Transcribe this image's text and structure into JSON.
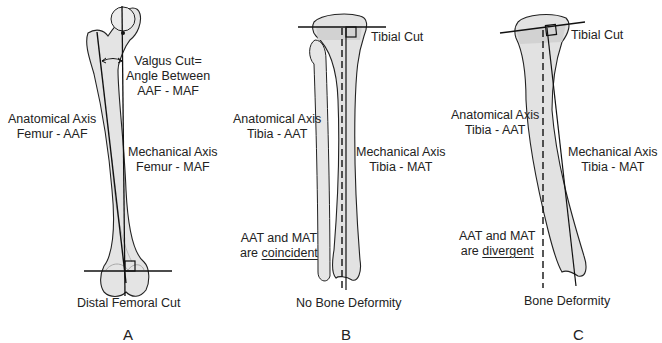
{
  "panels": [
    {
      "letter": "A",
      "bone": "femur",
      "labels": {
        "valgus_line1": "Valgus Cut=",
        "valgus_line2": "Angle Between",
        "valgus_line3": "AAF - MAF",
        "aaf_line1": "Anatomical Axis",
        "aaf_line2": "Femur - AAF",
        "maf_line1": "Mechanical Axis",
        "maf_line2": "Femur - MAF",
        "cut": "Distal Femoral Cut"
      }
    },
    {
      "letter": "B",
      "bone": "tibia",
      "labels": {
        "cut": "Tibial Cut",
        "aat_line1": "Anatomical Axis",
        "aat_line2": "Tibia - AAT",
        "mat_line1": "Mechanical Axis",
        "mat_line2": "Tibia - MAT",
        "relation_line1": "AAT and MAT",
        "relation_prefix": "are ",
        "relation_word": "coincident",
        "caption": "No Bone Deformity"
      }
    },
    {
      "letter": "C",
      "bone": "tibia",
      "labels": {
        "cut": "Tibial Cut",
        "aat_line1": "Anatomical Axis",
        "aat_line2": "Tibia - AAT",
        "mat_line1": "Mechanical Axis",
        "mat_line2": "Tibia - MAT",
        "relation_line1": "AAT and MAT",
        "relation_prefix": "are ",
        "relation_word": "divergent",
        "caption": "Bone Deformity"
      }
    }
  ],
  "colors": {
    "bone_fill": "#e4e4e4",
    "bone_shade": "#cfcfcf",
    "line": "#111111",
    "text": "#222222"
  }
}
